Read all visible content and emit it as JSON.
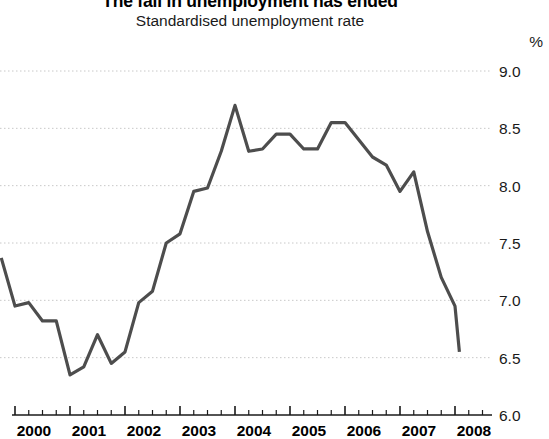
{
  "chart_data": {
    "type": "line",
    "title": "The fall in unemployment has ended",
    "subtitle": "Standardised unemployment rate",
    "unit_label": "%",
    "xlabel": "",
    "ylabel": "",
    "ylim": [
      6.0,
      9.0
    ],
    "xlim": [
      1999.75,
      2008.25
    ],
    "grid": true,
    "legend": null,
    "y_ticks": [
      "9.0",
      "8.5",
      "8.0",
      "7.5",
      "7.0",
      "6.5",
      "6.0"
    ],
    "y_tick_values": [
      9.0,
      8.5,
      8.0,
      7.5,
      7.0,
      6.5,
      6.0
    ],
    "x_ticks": [
      "2000",
      "2001",
      "2002",
      "2003",
      "2004",
      "2005",
      "2006",
      "2007",
      "2008"
    ],
    "x_tick_values": [
      2000,
      2001,
      2002,
      2003,
      2004,
      2005,
      2006,
      2007,
      2008
    ],
    "minor_ticks_per_interval": 3,
    "line_color": "#4d4d4d",
    "line_width": 3.2,
    "series": [
      {
        "name": "Standardised unemployment rate",
        "x": [
          1999.75,
          2000.0,
          2000.25,
          2000.5,
          2000.75,
          2001.0,
          2001.25,
          2001.5,
          2001.75,
          2002.0,
          2002.25,
          2002.5,
          2002.75,
          2003.0,
          2003.25,
          2003.5,
          2003.75,
          2004.0,
          2004.25,
          2004.5,
          2004.75,
          2005.0,
          2005.25,
          2005.5,
          2005.75,
          2006.0,
          2006.25,
          2006.5,
          2006.75,
          2007.0,
          2007.25,
          2007.5,
          2007.75,
          2008.0,
          2008.08
        ],
        "values": [
          7.37,
          6.95,
          6.98,
          6.82,
          6.82,
          6.35,
          6.42,
          6.7,
          6.45,
          6.55,
          6.98,
          7.08,
          7.5,
          7.58,
          7.95,
          7.98,
          8.3,
          8.7,
          8.3,
          8.32,
          8.45,
          8.45,
          8.32,
          8.32,
          8.55,
          8.55,
          8.4,
          8.25,
          8.18,
          7.95,
          8.12,
          7.6,
          7.2,
          6.95,
          6.55
        ]
      }
    ],
    "notable_points": {
      "start_2000q1": 7.37,
      "trough_2001q1": 6.35,
      "peak_2004q1": 8.7,
      "secondary_peak_2006": 8.55,
      "end_2008": 6.55
    }
  }
}
